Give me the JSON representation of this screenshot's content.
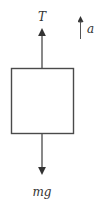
{
  "diagram": {
    "type": "free-body-diagram",
    "colors": {
      "stroke": "#4a4a4a",
      "text": "#333333",
      "background": "#ffffff"
    },
    "forces": [
      {
        "label": "T",
        "direction": "up"
      },
      {
        "label": "mg",
        "direction": "down"
      }
    ],
    "acceleration": {
      "label": "a",
      "direction": "up"
    }
  }
}
